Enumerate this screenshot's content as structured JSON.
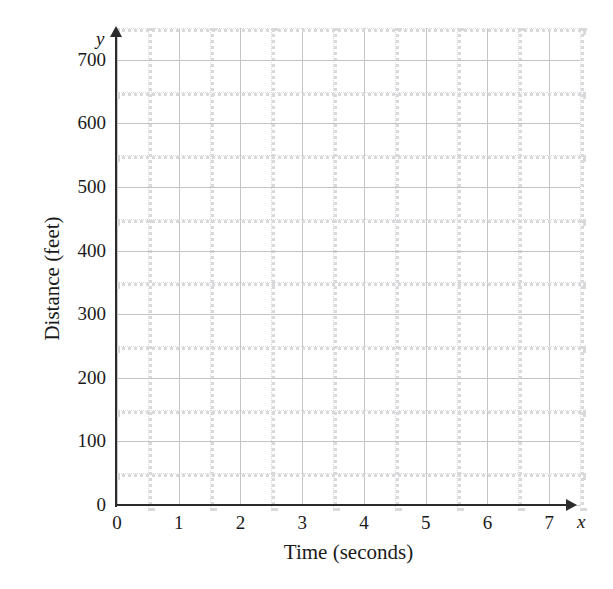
{
  "chart_data": {
    "type": "line",
    "title": "",
    "subtitle": "",
    "xlabel": "Time (seconds)",
    "ylabel": "Distance (feet)",
    "x_axis_symbol": "x",
    "y_axis_symbol": "y",
    "xlim": [
      0,
      7.5
    ],
    "ylim": [
      0,
      750
    ],
    "x_ticks": [
      0,
      1,
      2,
      3,
      4,
      5,
      6,
      7
    ],
    "x_tick_labels": [
      "0",
      "1",
      "2",
      "3",
      "4",
      "5",
      "6",
      "7"
    ],
    "y_ticks": [
      0,
      100,
      200,
      300,
      400,
      500,
      600,
      700
    ],
    "y_tick_labels": [
      "0",
      "100",
      "200",
      "300",
      "400",
      "500",
      "600",
      "700"
    ],
    "x_minor_step": 0.5,
    "y_minor_step": 50,
    "grid": true,
    "grid_major_color": "#c4c4c6",
    "grid_minor_color": "#d9d9dc",
    "axis_color": "#2b2b2b",
    "background_color": "#ffffff",
    "legend": null,
    "legend_position": "none",
    "series": [],
    "annotations": [],
    "note": "Empty coordinate grid with no plotted data points or curves."
  },
  "axes": {
    "x_gridlines": [
      {
        "value": 0,
        "major": true
      },
      {
        "value": 0.5,
        "major": false
      },
      {
        "value": 1,
        "major": true
      },
      {
        "value": 1.5,
        "major": false
      },
      {
        "value": 2,
        "major": true
      },
      {
        "value": 2.5,
        "major": false
      },
      {
        "value": 3,
        "major": true
      },
      {
        "value": 3.5,
        "major": false
      },
      {
        "value": 4,
        "major": true
      },
      {
        "value": 4.5,
        "major": false
      },
      {
        "value": 5,
        "major": true
      },
      {
        "value": 5.5,
        "major": false
      },
      {
        "value": 6,
        "major": true
      },
      {
        "value": 6.5,
        "major": false
      },
      {
        "value": 7,
        "major": true
      },
      {
        "value": 7.5,
        "major": false
      }
    ],
    "y_gridlines": [
      {
        "value": 0,
        "major": true
      },
      {
        "value": 50,
        "major": false
      },
      {
        "value": 100,
        "major": true
      },
      {
        "value": 150,
        "major": false
      },
      {
        "value": 200,
        "major": true
      },
      {
        "value": 250,
        "major": false
      },
      {
        "value": 300,
        "major": true
      },
      {
        "value": 350,
        "major": false
      },
      {
        "value": 400,
        "major": true
      },
      {
        "value": 450,
        "major": false
      },
      {
        "value": 500,
        "major": true
      },
      {
        "value": 550,
        "major": false
      },
      {
        "value": 600,
        "major": true
      },
      {
        "value": 650,
        "major": false
      },
      {
        "value": 700,
        "major": true
      },
      {
        "value": 750,
        "major": false
      }
    ]
  }
}
